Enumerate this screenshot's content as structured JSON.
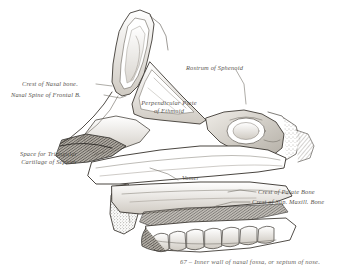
{
  "plate": {
    "type": "engraving",
    "subject": "Inner wall of nasal fossa, or septum of nose",
    "paper_color": "#ffffff",
    "ink_color": "#4a4640"
  },
  "labels": {
    "crest_of_nasal_bone": "Crest of Nasal bone.",
    "nasal_spine_of_frontal_bone": "Nasal Spine of Frontal B.",
    "space_for_triangular_cartilage_line1": "Space for Triangular",
    "space_for_triangular_cartilage_line2": "Cartilage of Septum",
    "perpendicular_plate_line1": "Perpendicular Plate",
    "perpendicular_plate_line2": "of Ethmoid",
    "rostrum_of_sphenoid": "Rostrum of Sphenoid",
    "vomer": "Vomer",
    "crest_of_palate_bone": "Crest of Palate Bone",
    "crest_of_sup_maxill_bone": "Crest of Sup. Maxill. Bone"
  },
  "caption": {
    "figure_number": "67",
    "dash": "–",
    "text": "Inner wall of nasal fossa, or septum of nose."
  }
}
